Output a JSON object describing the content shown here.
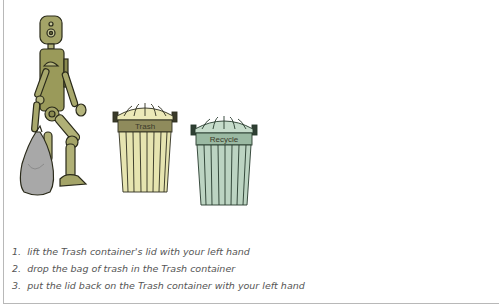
{
  "scene": {
    "robot": {
      "holding": "bag-of-trash",
      "colors": {
        "body": "#9a9a5a",
        "outline": "#2a2a1a",
        "bag": "#a8a8a8"
      }
    },
    "containers": [
      {
        "label": "Trash",
        "colors": {
          "body": "#e6e4b0",
          "band": "#8f8b5c",
          "outline": "#2f2f20"
        }
      },
      {
        "label": "Recycle",
        "colors": {
          "body": "#bcd4c2",
          "band": "#9ab9a2",
          "outline": "#263a2c"
        }
      }
    ]
  },
  "instructions": [
    {
      "number": "1.",
      "text": "lift the Trash container's lid with your left hand"
    },
    {
      "number": "2.",
      "text": "drop the bag of trash in the Trash container"
    },
    {
      "number": "3.",
      "text": "put the lid back on the Trash container with your left hand"
    }
  ]
}
